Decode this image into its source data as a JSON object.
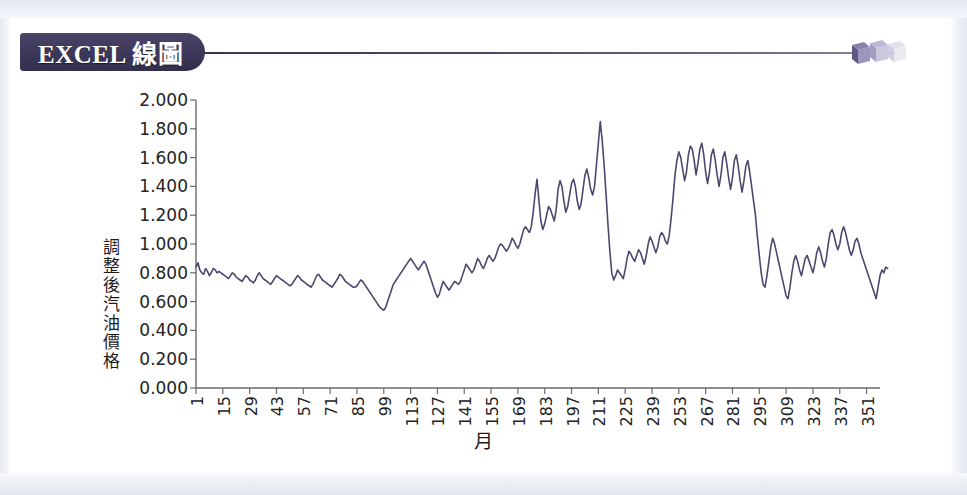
{
  "banner": {
    "badge_label": "EXCEL 線圖",
    "badge_color": "#3f3a5c",
    "rule_color": "#3b3752",
    "cube_colors": [
      "#6e6795",
      "#a9a4c6",
      "#d9d7e6"
    ],
    "cube_icon": "cube-decoration-icon"
  },
  "page": {
    "background": "#ffffff",
    "frame_color": "#e6e8f0"
  },
  "chart_data": {
    "type": "line",
    "title": "",
    "xlabel": "月",
    "ylabel": "調整後汽油價格",
    "line_color": "#4d4770",
    "grid": false,
    "legend": "none",
    "ylim": [
      0.0,
      2.0
    ],
    "ytick_labels": [
      "2.000",
      "1.800",
      "1.600",
      "1.400",
      "1.200",
      "1.000",
      "0.800",
      "0.600",
      "0.400",
      "0.200",
      "0.000"
    ],
    "ytick_values": [
      2.0,
      1.8,
      1.6,
      1.4,
      1.2,
      1.0,
      0.8,
      0.6,
      0.4,
      0.2,
      0.0
    ],
    "xlim": [
      1,
      358
    ],
    "xtick_labels": [
      "1",
      "15",
      "29",
      "43",
      "57",
      "71",
      "85",
      "99",
      "113",
      "127",
      "141",
      "155",
      "169",
      "183",
      "197",
      "211",
      "225",
      "239",
      "253",
      "267",
      "281",
      "295",
      "309",
      "323",
      "337",
      "351"
    ],
    "xtick_values": [
      1,
      15,
      29,
      43,
      57,
      71,
      85,
      99,
      113,
      127,
      141,
      155,
      169,
      183,
      197,
      211,
      225,
      239,
      253,
      267,
      281,
      295,
      309,
      323,
      337,
      351
    ],
    "series": [
      {
        "name": "調整後汽油價格",
        "x_start": 1,
        "x_step": 1,
        "values": [
          0.84,
          0.87,
          0.82,
          0.8,
          0.79,
          0.83,
          0.81,
          0.78,
          0.8,
          0.83,
          0.82,
          0.8,
          0.81,
          0.8,
          0.79,
          0.78,
          0.77,
          0.76,
          0.78,
          0.8,
          0.79,
          0.77,
          0.76,
          0.75,
          0.74,
          0.76,
          0.78,
          0.77,
          0.75,
          0.74,
          0.73,
          0.75,
          0.78,
          0.8,
          0.78,
          0.76,
          0.75,
          0.74,
          0.73,
          0.72,
          0.74,
          0.76,
          0.78,
          0.77,
          0.76,
          0.75,
          0.74,
          0.73,
          0.72,
          0.71,
          0.72,
          0.74,
          0.76,
          0.78,
          0.77,
          0.75,
          0.74,
          0.73,
          0.72,
          0.71,
          0.7,
          0.72,
          0.75,
          0.78,
          0.79,
          0.77,
          0.75,
          0.74,
          0.73,
          0.72,
          0.71,
          0.7,
          0.72,
          0.74,
          0.76,
          0.79,
          0.78,
          0.76,
          0.74,
          0.73,
          0.72,
          0.71,
          0.7,
          0.7,
          0.71,
          0.73,
          0.75,
          0.74,
          0.72,
          0.7,
          0.68,
          0.66,
          0.64,
          0.62,
          0.6,
          0.58,
          0.56,
          0.55,
          0.54,
          0.56,
          0.6,
          0.64,
          0.68,
          0.72,
          0.74,
          0.76,
          0.78,
          0.8,
          0.82,
          0.84,
          0.86,
          0.88,
          0.9,
          0.88,
          0.86,
          0.84,
          0.82,
          0.84,
          0.86,
          0.88,
          0.86,
          0.82,
          0.78,
          0.74,
          0.7,
          0.66,
          0.63,
          0.65,
          0.7,
          0.74,
          0.72,
          0.7,
          0.68,
          0.7,
          0.72,
          0.74,
          0.73,
          0.72,
          0.74,
          0.78,
          0.82,
          0.86,
          0.84,
          0.82,
          0.8,
          0.82,
          0.86,
          0.9,
          0.88,
          0.85,
          0.83,
          0.86,
          0.9,
          0.92,
          0.9,
          0.88,
          0.9,
          0.94,
          0.98,
          1.0,
          0.99,
          0.97,
          0.95,
          0.97,
          1.0,
          1.04,
          1.02,
          0.99,
          0.97,
          1.0,
          1.05,
          1.1,
          1.12,
          1.1,
          1.08,
          1.12,
          1.22,
          1.35,
          1.45,
          1.3,
          1.16,
          1.1,
          1.14,
          1.2,
          1.26,
          1.24,
          1.2,
          1.16,
          1.24,
          1.38,
          1.44,
          1.4,
          1.3,
          1.22,
          1.26,
          1.34,
          1.42,
          1.45,
          1.4,
          1.3,
          1.24,
          1.28,
          1.38,
          1.48,
          1.52,
          1.46,
          1.38,
          1.34,
          1.4,
          1.55,
          1.7,
          1.85,
          1.72,
          1.55,
          1.35,
          1.14,
          0.95,
          0.8,
          0.75,
          0.78,
          0.82,
          0.8,
          0.78,
          0.76,
          0.82,
          0.9,
          0.95,
          0.93,
          0.9,
          0.88,
          0.92,
          0.96,
          0.94,
          0.9,
          0.86,
          0.92,
          1.0,
          1.05,
          1.02,
          0.98,
          0.94,
          0.98,
          1.05,
          1.08,
          1.06,
          1.02,
          1.0,
          1.06,
          1.18,
          1.32,
          1.48,
          1.58,
          1.64,
          1.6,
          1.52,
          1.44,
          1.5,
          1.62,
          1.68,
          1.66,
          1.58,
          1.48,
          1.56,
          1.66,
          1.7,
          1.62,
          1.5,
          1.42,
          1.5,
          1.62,
          1.66,
          1.58,
          1.48,
          1.4,
          1.48,
          1.6,
          1.64,
          1.56,
          1.46,
          1.38,
          1.46,
          1.58,
          1.62,
          1.54,
          1.44,
          1.36,
          1.44,
          1.54,
          1.58,
          1.5,
          1.4,
          1.3,
          1.2,
          1.05,
          0.92,
          0.8,
          0.72,
          0.7,
          0.78,
          0.88,
          0.98,
          1.04,
          1.0,
          0.94,
          0.88,
          0.82,
          0.76,
          0.7,
          0.64,
          0.62,
          0.7,
          0.8,
          0.88,
          0.92,
          0.88,
          0.82,
          0.78,
          0.84,
          0.9,
          0.92,
          0.88,
          0.84,
          0.8,
          0.86,
          0.94,
          0.98,
          0.94,
          0.88,
          0.84,
          0.9,
          1.0,
          1.08,
          1.1,
          1.06,
          1.0,
          0.96,
          1.0,
          1.08,
          1.12,
          1.08,
          1.02,
          0.96,
          0.92,
          0.96,
          1.02,
          1.04,
          1.0,
          0.94,
          0.9,
          0.86,
          0.82,
          0.78,
          0.74,
          0.7,
          0.66,
          0.62,
          0.7,
          0.78,
          0.82,
          0.8,
          0.84,
          0.83
        ]
      }
    ]
  }
}
